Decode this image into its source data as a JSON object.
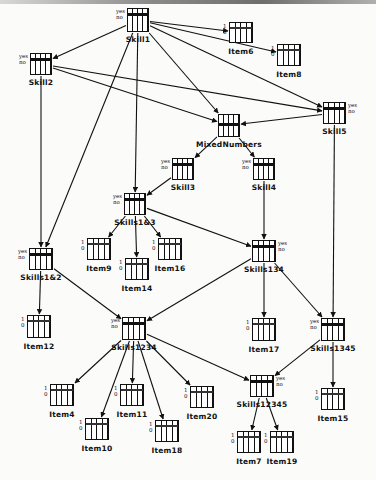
{
  "diagram": {
    "type": "bayesian-network",
    "skill_state_labels": [
      "yes",
      "no"
    ],
    "item_state_labels": [
      "1",
      "0"
    ],
    "nodes": [
      {
        "id": "Skill1",
        "label": "Skill1",
        "kind": "skill",
        "x": 127,
        "y": 8,
        "w": 22,
        "h": 24,
        "yn": "left"
      },
      {
        "id": "Item6",
        "label": "Item6",
        "kind": "item",
        "x": 229,
        "y": 22,
        "w": 24,
        "h": 21
      },
      {
        "id": "Item8",
        "label": "Item8",
        "kind": "item",
        "x": 277,
        "y": 44,
        "w": 24,
        "h": 22
      },
      {
        "id": "Skill2",
        "label": "Skill2",
        "kind": "skill",
        "x": 30,
        "y": 53,
        "w": 22,
        "h": 22,
        "yn": "left"
      },
      {
        "id": "Skill5",
        "label": "Skill5",
        "kind": "skill",
        "x": 323,
        "y": 102,
        "w": 23,
        "h": 22,
        "yn": "right"
      },
      {
        "id": "MixedNumbers",
        "label": "MixedNumbers",
        "kind": "skill",
        "x": 218,
        "y": 114,
        "w": 22,
        "h": 23,
        "yn": "none"
      },
      {
        "id": "Skill3",
        "label": "Skill3",
        "kind": "skill",
        "x": 172,
        "y": 158,
        "w": 22,
        "h": 22,
        "yn": "left"
      },
      {
        "id": "Skill4",
        "label": "Skill4",
        "kind": "skill",
        "x": 253,
        "y": 158,
        "w": 22,
        "h": 22,
        "yn": "left"
      },
      {
        "id": "Skills1&3",
        "label": "Skills1&3",
        "kind": "skill",
        "x": 124,
        "y": 193,
        "w": 22,
        "h": 22,
        "yn": "left"
      },
      {
        "id": "Item9",
        "label": "Item9",
        "kind": "item",
        "x": 87,
        "y": 238,
        "w": 24,
        "h": 22
      },
      {
        "id": "Item14",
        "label": "Item14",
        "kind": "item",
        "x": 125,
        "y": 258,
        "w": 24,
        "h": 22
      },
      {
        "id": "Item16",
        "label": "Item16",
        "kind": "item",
        "x": 158,
        "y": 238,
        "w": 24,
        "h": 22
      },
      {
        "id": "Skills1&2",
        "label": "Skills1&2",
        "kind": "skill",
        "x": 29,
        "y": 248,
        "w": 24,
        "h": 22,
        "yn": "left"
      },
      {
        "id": "Skills134",
        "label": "Skills134",
        "kind": "skill",
        "x": 252,
        "y": 240,
        "w": 24,
        "h": 22,
        "yn": "right"
      },
      {
        "id": "Item12",
        "label": "Item12",
        "kind": "item",
        "x": 27,
        "y": 315,
        "w": 24,
        "h": 23
      },
      {
        "id": "Skills1234",
        "label": "Skills1234",
        "kind": "skill",
        "x": 122,
        "y": 317,
        "w": 24,
        "h": 23,
        "yn": "left"
      },
      {
        "id": "Item17",
        "label": "Item17",
        "kind": "item",
        "x": 252,
        "y": 318,
        "w": 24,
        "h": 23
      },
      {
        "id": "Skills1345",
        "label": "Skills1345",
        "kind": "skill",
        "x": 321,
        "y": 318,
        "w": 24,
        "h": 23,
        "yn": "left"
      },
      {
        "id": "Item4",
        "label": "Item4",
        "kind": "item",
        "x": 50,
        "y": 384,
        "w": 24,
        "h": 22
      },
      {
        "id": "Item11",
        "label": "Item11",
        "kind": "item",
        "x": 120,
        "y": 384,
        "w": 24,
        "h": 22
      },
      {
        "id": "Item20",
        "label": "Item20",
        "kind": "item",
        "x": 190,
        "y": 386,
        "w": 24,
        "h": 22
      },
      {
        "id": "Item10",
        "label": "Item10",
        "kind": "item",
        "x": 85,
        "y": 418,
        "w": 24,
        "h": 22
      },
      {
        "id": "Item18",
        "label": "Item18",
        "kind": "item",
        "x": 155,
        "y": 420,
        "w": 24,
        "h": 22
      },
      {
        "id": "Skills12345",
        "label": "Skills12345",
        "kind": "skill",
        "x": 250,
        "y": 375,
        "w": 24,
        "h": 22,
        "yn": "right"
      },
      {
        "id": "Item15",
        "label": "Item15",
        "kind": "item",
        "x": 321,
        "y": 388,
        "w": 24,
        "h": 22
      },
      {
        "id": "Item7",
        "label": "Item7",
        "kind": "item",
        "x": 237,
        "y": 431,
        "w": 24,
        "h": 22
      },
      {
        "id": "Item19",
        "label": "Item19",
        "kind": "item",
        "x": 270,
        "y": 431,
        "w": 24,
        "h": 22
      }
    ],
    "edges": [
      [
        "Skill1",
        "Item6"
      ],
      [
        "Skill1",
        "Item8"
      ],
      [
        "Skill1",
        "Skill2"
      ],
      [
        "Skill1",
        "MixedNumbers"
      ],
      [
        "Skill1",
        "Skill5"
      ],
      [
        "Skill1",
        "Skills1&3"
      ],
      [
        "Skill1",
        "Skills1&2"
      ],
      [
        "Skill2",
        "MixedNumbers"
      ],
      [
        "Skill2",
        "Skill5"
      ],
      [
        "Skill2",
        "Skills1&2"
      ],
      [
        "Skill5",
        "MixedNumbers"
      ],
      [
        "Skill5",
        "Skills1345"
      ],
      [
        "MixedNumbers",
        "Skill3"
      ],
      [
        "MixedNumbers",
        "Skill4"
      ],
      [
        "Skill3",
        "Skills1&3"
      ],
      [
        "Skill4",
        "Skills134"
      ],
      [
        "Skills1&3",
        "Item9"
      ],
      [
        "Skills1&3",
        "Item14"
      ],
      [
        "Skills1&3",
        "Item16"
      ],
      [
        "Skills1&3",
        "Skills134"
      ],
      [
        "Skills1&2",
        "Item12"
      ],
      [
        "Skills1&2",
        "Skills1234"
      ],
      [
        "Skills134",
        "Skills1234"
      ],
      [
        "Skills134",
        "Item17"
      ],
      [
        "Skills134",
        "Skills1345"
      ],
      [
        "Skills1234",
        "Item4"
      ],
      [
        "Skills1234",
        "Item10"
      ],
      [
        "Skills1234",
        "Item11"
      ],
      [
        "Skills1234",
        "Item18"
      ],
      [
        "Skills1234",
        "Item20"
      ],
      [
        "Skills1234",
        "Skills12345"
      ],
      [
        "Skills1345",
        "Skills12345"
      ],
      [
        "Skills1345",
        "Item15"
      ],
      [
        "Skills12345",
        "Item7"
      ],
      [
        "Skills12345",
        "Item19"
      ]
    ]
  }
}
